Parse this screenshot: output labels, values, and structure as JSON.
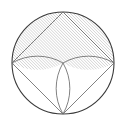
{
  "figure": {
    "canvas": {
      "width": 126,
      "height": 129,
      "background": "#ffffff"
    },
    "style": {
      "stroke_color": "#3a3a3a",
      "stroke_color_light": "#6b6b6b",
      "stroke_width_outer": 1.1,
      "stroke_width_inner": 0.85,
      "hatch_color": "#8c8c8c",
      "hatch_width": 0.55,
      "hatch_spacing": 2.1,
      "hatch_angle_deg": 45,
      "fill": "none"
    },
    "circle": {
      "label": "outer-circle",
      "cx": 63,
      "cy": 63,
      "r": 51
    },
    "points": {
      "top": {
        "label": "T",
        "x": 63,
        "y": 12
      },
      "bottom": {
        "label": "B",
        "x": 63,
        "y": 114
      },
      "left": {
        "label": "L",
        "x": 12,
        "y": 63
      },
      "right": {
        "label": "R",
        "x": 114,
        "y": 63
      },
      "center": {
        "label": "O",
        "x": 63,
        "y": 63
      }
    },
    "chords": [
      {
        "name": "chord-left-top",
        "x1": 12,
        "y1": 63,
        "x2": 63,
        "y2": 12
      },
      {
        "name": "chord-right-top",
        "x1": 114,
        "y1": 63,
        "x2": 63,
        "y2": 12
      },
      {
        "name": "chord-left-bottom",
        "x1": 12,
        "y1": 63,
        "x2": 63,
        "y2": 114
      },
      {
        "name": "chord-right-bottom",
        "x1": 114,
        "y1": 63,
        "x2": 63,
        "y2": 114
      }
    ],
    "arcs": [
      {
        "name": "arc-left-upper-to-center",
        "from": "left",
        "to": "center",
        "r": 51,
        "sweep": 1
      },
      {
        "name": "arc-right-upper-to-center",
        "from": "right",
        "to": "center",
        "r": 51,
        "sweep": 0
      },
      {
        "name": "arc-center-to-bottom-left",
        "from": "center",
        "to": "bottom",
        "r": 51,
        "sweep": 1
      },
      {
        "name": "arc-center-to-bottom-right",
        "from": "center",
        "to": "bottom",
        "r": 51,
        "sweep": 0
      }
    ],
    "hatched_region": {
      "name": "upper-hatched-lobes",
      "description": "Region between the upper semicircular arc and the two inner arcs meeting at the circle center"
    }
  }
}
